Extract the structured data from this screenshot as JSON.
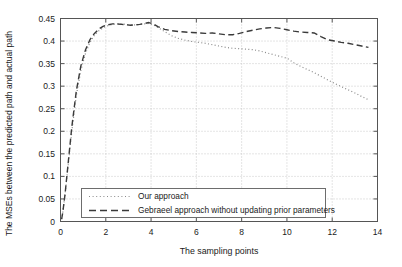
{
  "chart_data": {
    "type": "line",
    "title": "",
    "xlabel": "The sampling points",
    "ylabel": "The MSEs between the predicted path and actual path",
    "xlim": [
      0,
      14
    ],
    "ylim": [
      0,
      0.45
    ],
    "grid": true,
    "legend_position": "lower-left-inside",
    "xticks": [
      "0",
      "2",
      "4",
      "6",
      "8",
      "10",
      "12",
      "14"
    ],
    "xtick_values": [
      0,
      2,
      4,
      6,
      8,
      10,
      12,
      14
    ],
    "yticks": [
      "0",
      "0.05",
      "0.1",
      "0.15",
      "0.2",
      "0.25",
      "0.3",
      "0.35",
      "0.4",
      "0.45"
    ],
    "ytick_values": [
      0,
      0.05,
      0.1,
      0.15,
      0.2,
      0.25,
      0.3,
      0.35,
      0.4,
      0.45
    ],
    "series": [
      {
        "name": "Our approach",
        "style": "dotted",
        "color": "#8a8a8a",
        "x": [
          0.05,
          0.1,
          0.2,
          0.35,
          0.5,
          0.7,
          0.9,
          1.1,
          1.3,
          1.5,
          1.7,
          1.9,
          2.1,
          2.3,
          2.5,
          2.7,
          2.9,
          3.1,
          3.3,
          3.5,
          3.7,
          3.9,
          4.1,
          4.3,
          4.5,
          4.7,
          4.9,
          5.2,
          5.5,
          5.8,
          6.1,
          6.4,
          6.7,
          7.0,
          7.3,
          7.6,
          7.9,
          8.2,
          8.5,
          8.8,
          9.1,
          9.4,
          9.7,
          10.0,
          10.3,
          10.6,
          10.9,
          11.2,
          11.5,
          11.8,
          12.1,
          12.4,
          12.7,
          13.0,
          13.3,
          13.6
        ],
        "y": [
          0.005,
          0.02,
          0.06,
          0.13,
          0.2,
          0.28,
          0.335,
          0.372,
          0.397,
          0.413,
          0.423,
          0.43,
          0.434,
          0.437,
          0.438,
          0.438,
          0.437,
          0.436,
          0.436,
          0.437,
          0.438,
          0.439,
          0.436,
          0.43,
          0.424,
          0.418,
          0.412,
          0.406,
          0.402,
          0.399,
          0.397,
          0.395,
          0.392,
          0.389,
          0.386,
          0.384,
          0.383,
          0.382,
          0.381,
          0.378,
          0.374,
          0.37,
          0.366,
          0.362,
          0.352,
          0.344,
          0.337,
          0.33,
          0.322,
          0.314,
          0.306,
          0.299,
          0.292,
          0.285,
          0.277,
          0.27
        ]
      },
      {
        "name": "Gebraeel approach without updating prior parameters",
        "style": "dashed",
        "color": "#3a3a3a",
        "x": [
          0.05,
          0.1,
          0.2,
          0.35,
          0.5,
          0.7,
          0.9,
          1.1,
          1.3,
          1.5,
          1.7,
          1.9,
          2.1,
          2.3,
          2.5,
          2.7,
          2.9,
          3.1,
          3.3,
          3.5,
          3.7,
          3.9,
          4.1,
          4.3,
          4.6,
          4.9,
          5.2,
          5.5,
          5.8,
          6.1,
          6.4,
          6.7,
          7.0,
          7.3,
          7.6,
          7.9,
          8.2,
          8.5,
          8.8,
          9.1,
          9.4,
          9.7,
          10.0,
          10.3,
          10.6,
          10.9,
          11.2,
          11.5,
          11.8,
          12.1,
          12.4,
          12.7,
          13.0,
          13.3,
          13.6
        ],
        "y": [
          0.005,
          0.02,
          0.06,
          0.135,
          0.21,
          0.29,
          0.345,
          0.38,
          0.403,
          0.417,
          0.427,
          0.433,
          0.436,
          0.438,
          0.438,
          0.437,
          0.436,
          0.435,
          0.436,
          0.437,
          0.439,
          0.441,
          0.438,
          0.432,
          0.426,
          0.423,
          0.421,
          0.42,
          0.419,
          0.418,
          0.417,
          0.418,
          0.416,
          0.414,
          0.414,
          0.417,
          0.421,
          0.424,
          0.427,
          0.429,
          0.43,
          0.428,
          0.425,
          0.422,
          0.42,
          0.419,
          0.418,
          0.41,
          0.403,
          0.4,
          0.397,
          0.395,
          0.392,
          0.389,
          0.386
        ]
      }
    ],
    "legend": [
      {
        "label": "Our approach",
        "style": "dotted"
      },
      {
        "label": "Gebraeel approach without updating prior parameters",
        "style": "dashed"
      }
    ]
  }
}
